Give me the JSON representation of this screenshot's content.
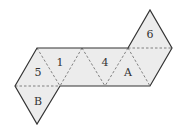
{
  "diagram": {
    "type": "octahedron-net",
    "labels": {
      "face_5": "5",
      "face_1": "1",
      "face_4": "4",
      "face_A": "A",
      "face_6": "6",
      "face_B": "B"
    },
    "fill_color": "#ececec",
    "edge_color": "#333333",
    "fold_color": "#666666"
  }
}
